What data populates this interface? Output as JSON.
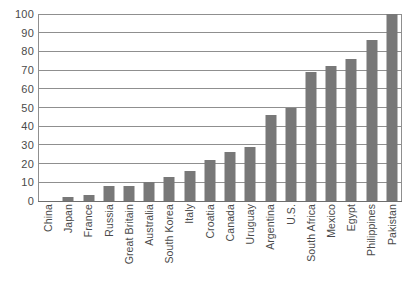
{
  "chart_data": {
    "type": "bar",
    "title": "",
    "subtitle": "",
    "xlabel": "",
    "ylabel": "",
    "ylim": [
      0,
      100
    ],
    "ytick_step": 10,
    "yticks": [
      0,
      10,
      20,
      30,
      40,
      50,
      60,
      70,
      80,
      90,
      100
    ],
    "grid": true,
    "legend": false,
    "legend_position": "none",
    "bar_color": "#787878",
    "gridline_color": "#8f8f8f",
    "text_color": "#4a4a4a",
    "background_color": "#ffffff",
    "xtick_rotation": 90,
    "categories": [
      "China",
      "Japan",
      "France",
      "Russia",
      "Great Britain",
      "Australia",
      "South Korea",
      "Italy",
      "Croatia",
      "Canada",
      "Uruguay",
      "Argentina",
      "U.S.",
      "South Africa",
      "Mexico",
      "Egypt",
      "Philippines",
      "Pakistan"
    ],
    "values": [
      0,
      2,
      3,
      8,
      8,
      10,
      13,
      16,
      22,
      26,
      29,
      46,
      50,
      69,
      72,
      76,
      86,
      100
    ]
  }
}
